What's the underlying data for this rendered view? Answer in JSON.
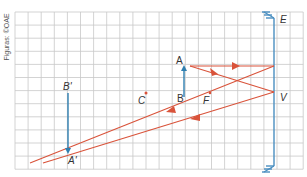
{
  "credit": "Figuras: ©OAE",
  "colors": {
    "grid": "#c8c8c8",
    "ray": "#d9533a",
    "object": "#2f7fb0",
    "mirror": "#4a8fc0",
    "label": "#333333"
  },
  "labels": {
    "A": "A",
    "B": "B",
    "A_prime": "A'",
    "B_prime": "B'",
    "C": "C",
    "F": "F",
    "V": "V",
    "E": "E"
  },
  "grid": {
    "x0": 15,
    "y0": 12,
    "cell": 13.1,
    "cols": 22,
    "rows": 12
  }
}
